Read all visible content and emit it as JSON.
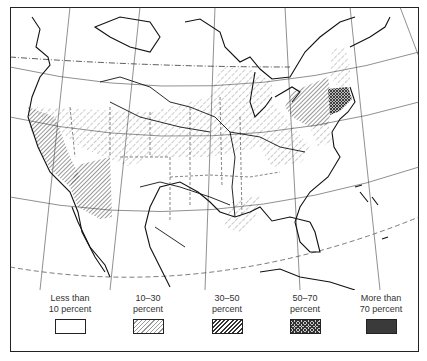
{
  "map": {
    "type": "choropleth",
    "region": "North America (United States, southern Canada, northern Mexico, Caribbean)",
    "shaded_regions": {
      "30-50 percent": [
        "California",
        "Arizona",
        "New York",
        "Pennsylvania"
      ],
      "50-70 percent": [
        "Massachusetts",
        "Connecticut",
        "Rhode Island",
        "New Jersey"
      ],
      "10-30 percent": [
        "Oregon (southern)",
        "Nevada",
        "Utah",
        "Colorado",
        "Northern Plains",
        "Midwest",
        "Great Lakes",
        "Kentucky",
        "Louisiana (part)",
        "Texas (part)",
        "Maine",
        "Vermont",
        "New Hampshire",
        "Maryland",
        "Delaware"
      ]
    }
  },
  "legend": {
    "items": [
      {
        "label": "Less than\n10 percent",
        "fill": "none"
      },
      {
        "label": "10–30\npercent",
        "fill": "light-hatch"
      },
      {
        "label": "30–50\npercent",
        "fill": "diagonal-hatch"
      },
      {
        "label": "50–70\npercent",
        "fill": "cross-hatch"
      },
      {
        "label": "More than\n70 percent",
        "fill": "dark"
      }
    ]
  }
}
